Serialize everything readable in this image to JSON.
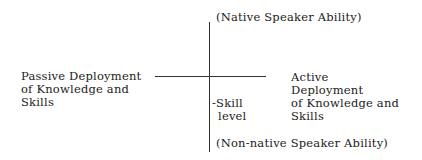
{
  "diagram": {
    "top_label": "(Native Speaker Ability)",
    "bottom_label": "(Non-native Speaker Ability)",
    "left_label": [
      "Passive Deployment",
      "of Knowledge and",
      "Skills"
    ],
    "right_label": [
      "Active",
      "Deployment",
      "of Knowledge and",
      "Skills"
    ],
    "axis_label": [
      "-Skill",
      "level"
    ]
  }
}
